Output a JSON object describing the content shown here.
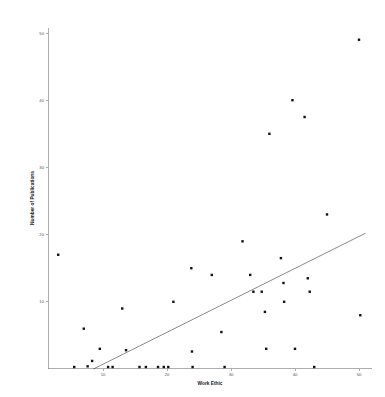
{
  "chart_data": {
    "type": "scatter",
    "title": "",
    "xlabel": "Work Ethic",
    "ylabel": "Number of Publications",
    "xlim": [
      0,
      52
    ],
    "ylim": [
      0,
      52
    ],
    "xticks": [
      10,
      20,
      30,
      40,
      50
    ],
    "yticks": [
      10,
      20,
      30,
      40,
      50
    ],
    "grid": false,
    "legend": "none",
    "marker": "square",
    "marker_color": "#111111",
    "series": [
      {
        "name": "observations",
        "points": [
          {
            "x": 3.0,
            "y": 17.0
          },
          {
            "x": 5.5,
            "y": 0.3
          },
          {
            "x": 7.0,
            "y": 6.0
          },
          {
            "x": 7.6,
            "y": 0.4
          },
          {
            "x": 8.3,
            "y": 1.2
          },
          {
            "x": 9.5,
            "y": 3.0
          },
          {
            "x": 10.8,
            "y": 0.3
          },
          {
            "x": 11.5,
            "y": 0.3
          },
          {
            "x": 13.0,
            "y": 9.0
          },
          {
            "x": 13.6,
            "y": 2.8
          },
          {
            "x": 15.7,
            "y": 0.3
          },
          {
            "x": 16.7,
            "y": 0.3
          },
          {
            "x": 18.6,
            "y": 0.3
          },
          {
            "x": 19.5,
            "y": 0.3
          },
          {
            "x": 20.2,
            "y": 0.3
          },
          {
            "x": 21.0,
            "y": 10.0
          },
          {
            "x": 23.8,
            "y": 15.0
          },
          {
            "x": 23.9,
            "y": 2.6
          },
          {
            "x": 24.0,
            "y": 0.3
          },
          {
            "x": 27.0,
            "y": 14.0
          },
          {
            "x": 28.5,
            "y": 5.5
          },
          {
            "x": 29.0,
            "y": 0.3
          },
          {
            "x": 31.8,
            "y": 19.0
          },
          {
            "x": 33.0,
            "y": 14.0
          },
          {
            "x": 33.5,
            "y": 11.5
          },
          {
            "x": 34.8,
            "y": 11.5
          },
          {
            "x": 35.3,
            "y": 8.5
          },
          {
            "x": 35.5,
            "y": 3.0
          },
          {
            "x": 36.0,
            "y": 35.0
          },
          {
            "x": 37.8,
            "y": 16.5
          },
          {
            "x": 38.2,
            "y": 12.8
          },
          {
            "x": 38.3,
            "y": 10.0
          },
          {
            "x": 39.6,
            "y": 40.0
          },
          {
            "x": 40.0,
            "y": 3.0
          },
          {
            "x": 41.5,
            "y": 37.5
          },
          {
            "x": 42.0,
            "y": 13.5
          },
          {
            "x": 42.3,
            "y": 11.5
          },
          {
            "x": 43.0,
            "y": 0.3
          },
          {
            "x": 45.0,
            "y": 23.0
          },
          {
            "x": 50.0,
            "y": 49.0
          },
          {
            "x": 50.2,
            "y": 8.0
          }
        ]
      }
    ],
    "fit_line": {
      "name": "regression-line",
      "x_start": 8.5,
      "y_start": 0.0,
      "x_end": 51.0,
      "y_end": 20.2,
      "color": "#3a3a3a"
    }
  }
}
